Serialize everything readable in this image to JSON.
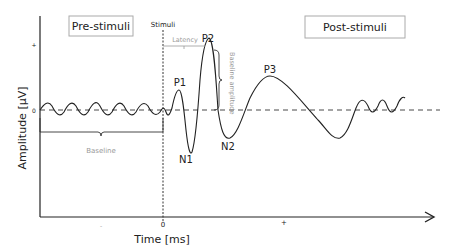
{
  "diagram": {
    "regions": {
      "pre": "Pre-stimuli",
      "post": "Post-stimuli"
    },
    "stimuli_label": "Stimuli",
    "latency_label": "Latency",
    "baseline_amplitude_label": "Baseline amplitude",
    "baseline_label": "Baseline",
    "peaks": [
      "P1",
      "N1",
      "P2",
      "N2",
      "P3"
    ],
    "axes": {
      "ylabel": "Amplitude [µV]",
      "xlabel": "Time [ms]",
      "y_ticks": {
        "plus": "+",
        "zero": "0"
      },
      "x_ticks": {
        "minus": "-",
        "zero": "0",
        "plus": "+"
      }
    },
    "colors": {
      "line": "#222222",
      "annotation": "#999999",
      "box_border": "#aaaaaa"
    }
  }
}
